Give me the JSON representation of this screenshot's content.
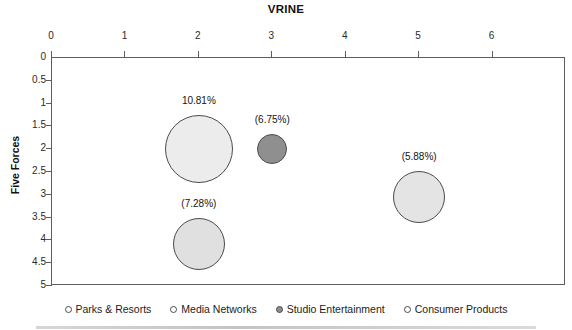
{
  "chart_data": {
    "type": "scatter",
    "title": "VRINE",
    "xlabel": "VRINE",
    "ylabel": "Five Forces",
    "xlim": [
      0,
      7
    ],
    "ylim": [
      0,
      5
    ],
    "y_inverted": true,
    "grid": false,
    "legend_position": "bottom",
    "xticks": [
      "0",
      "1",
      "2",
      "3",
      "4",
      "5",
      "6"
    ],
    "xtick_values": [
      0,
      1,
      2,
      3,
      4,
      5,
      6
    ],
    "yticks": [
      "0",
      "0.5",
      "1",
      "1.5",
      "2",
      "2.5",
      "3",
      "3.5",
      "4",
      "4.5",
      "5"
    ],
    "ytick_values": [
      0,
      0.5,
      1,
      1.5,
      2,
      2.5,
      3,
      3.5,
      4,
      4.5,
      5
    ],
    "points": [
      {
        "name": "Media Networks",
        "x": 2,
        "y": 2,
        "size_label": "10.81%",
        "size_value": 10.81,
        "radius_px": 34,
        "fill": "#ececec",
        "stroke": "#4b4b4b",
        "label_dx": 0,
        "label_dy": -47
      },
      {
        "name": "Studio Entertainment",
        "x": 3,
        "y": 2,
        "size_label": "(6.75%)",
        "size_value": 6.75,
        "radius_px": 15,
        "fill": "#8f8f8f",
        "stroke": "#4b4b4b",
        "label_dx": 0,
        "label_dy": -28
      },
      {
        "name": "Consumer Products",
        "x": 5,
        "y": 3.05,
        "size_label": "(5.88%)",
        "size_value": 5.88,
        "radius_px": 26,
        "fill": "#e4e4e4",
        "stroke": "#4b4b4b",
        "label_dx": 0,
        "label_dy": -39
      },
      {
        "name": "Parks & Resorts",
        "x": 2,
        "y": 4.08,
        "size_label": "(7.28%)",
        "size_value": 7.28,
        "radius_px": 26,
        "fill": "#e0e0e0",
        "stroke": "#4b4b4b",
        "label_dx": 0,
        "label_dy": -39
      }
    ],
    "legend": [
      {
        "label": "Parks & Resorts",
        "fill": "#ffffff",
        "stroke": "#4b4b4b"
      },
      {
        "label": "Media Networks",
        "fill": "#ffffff",
        "stroke": "#4b4b4b"
      },
      {
        "label": "Studio Entertainment",
        "fill": "#8f8f8f",
        "stroke": "#4b4b4b"
      },
      {
        "label": "Consumer Products",
        "fill": "#ffffff",
        "stroke": "#4b4b4b"
      }
    ]
  }
}
